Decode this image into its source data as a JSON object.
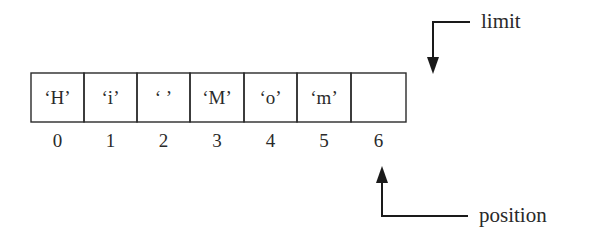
{
  "diagram": {
    "title": "",
    "buffer": {
      "cells": [
        {
          "index": "0",
          "value": "‘H’"
        },
        {
          "index": "1",
          "value": "‘i’"
        },
        {
          "index": "2",
          "value": "‘ ’"
        },
        {
          "index": "3",
          "value": "‘M’"
        },
        {
          "index": "4",
          "value": "‘o’"
        },
        {
          "index": "5",
          "value": "‘m’"
        },
        {
          "index": "6",
          "value": ""
        }
      ]
    },
    "pointers": {
      "limit": {
        "label": "limit",
        "points_to_index": 6,
        "side": "top"
      },
      "position": {
        "label": "position",
        "points_to_index": 6,
        "side": "bottom"
      }
    }
  }
}
